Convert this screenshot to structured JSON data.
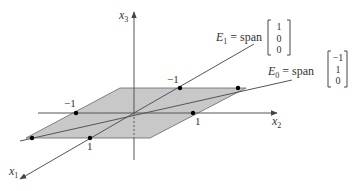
{
  "diagram": {
    "axes": {
      "x1": {
        "name": "x",
        "sub": "1"
      },
      "x2": {
        "name": "x",
        "sub": "2"
      },
      "x3": {
        "name": "x",
        "sub": "3"
      }
    },
    "ticks": {
      "x2_neg": "−1",
      "x2_pos": "1",
      "x1_neg": "−1",
      "x1_pos": "1"
    },
    "eigenspaces": [
      {
        "name": "E",
        "sub": "1",
        "eq": "= span",
        "vector": [
          "1",
          "0",
          "0"
        ]
      },
      {
        "name": "E",
        "sub": "0",
        "eq": "= span",
        "vector": [
          "−1",
          "1",
          "0"
        ]
      }
    ],
    "colors": {
      "plane": "#c8c8c8",
      "line": "#555555",
      "point": "#000000"
    }
  }
}
